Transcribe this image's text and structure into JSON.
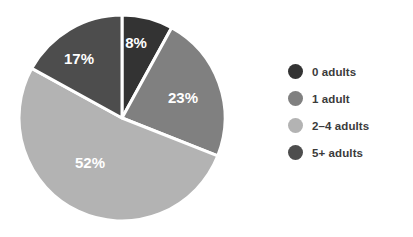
{
  "chart_data": {
    "type": "pie",
    "title": "",
    "subtitle": "",
    "xlabel": "",
    "ylabel": "",
    "grid": false,
    "legend_position": "right",
    "start_angle_deg": 0,
    "direction": "clockwise",
    "separator_color": "#ffffff",
    "background": "#ffffff",
    "categories": [
      "0 adults",
      "1 adult",
      "2–4 adults",
      "5+ adults"
    ],
    "values": [
      8,
      23,
      52,
      17
    ],
    "value_unit": "%",
    "data_labels": [
      "8%",
      "23%",
      "52%",
      "17%"
    ],
    "colors": [
      "#333333",
      "#808080",
      "#b3b3b3",
      "#4d4d4d"
    ],
    "label_color": "#ffffff",
    "slices": [
      {
        "label": "0 adults",
        "value": 8,
        "data_label": "8%",
        "color": "#333333",
        "label_x": 136,
        "label_y": 44
      },
      {
        "label": "1 adult",
        "value": 23,
        "data_label": "23%",
        "color": "#808080",
        "label_x": 183,
        "label_y": 99
      },
      {
        "label": "2–4 adults",
        "value": 52,
        "data_label": "52%",
        "color": "#b3b3b3",
        "label_x": 90,
        "label_y": 164
      },
      {
        "label": "5+ adults",
        "value": 17,
        "data_label": "17%",
        "color": "#4d4d4d",
        "label_x": 79,
        "label_y": 60
      }
    ],
    "geometry": {
      "center_x": 122,
      "center_y": 118,
      "radius": 103
    }
  },
  "legend": {
    "items": [
      {
        "label": "0 adults",
        "color": "#333333"
      },
      {
        "label": "1 adult",
        "color": "#808080"
      },
      {
        "label": "2–4 adults",
        "color": "#b3b3b3"
      },
      {
        "label": "5+ adults",
        "color": "#4d4d4d"
      }
    ]
  }
}
